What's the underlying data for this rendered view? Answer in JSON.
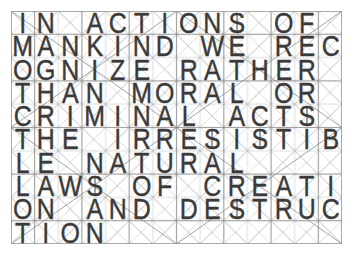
{
  "artwork": {
    "title": "IN ACTIONS OF MANKIND WE RECOGNIZE RATHER THAN MORAL OR CRIMINAL ACTS THE IRRESISTIBLE NATURAL LAWS OF CREATION AND DESTRUCTION",
    "medium_note": "geometric letterforms constructed on a ruled square grid with full X diagonals",
    "paper_color": "#ffffff",
    "ink_color": "#3a3a3a",
    "grid_color": "#b9b9b9",
    "diagonal_color": "#cfcfcf",
    "s_is_rendered_as_dollar_sign": true,
    "columns": 14,
    "rows": 10,
    "lines": [
      {
        "index": 1,
        "text": "IN ACTIONS OF"
      },
      {
        "index": 2,
        "text": "MANKIND WE REC"
      },
      {
        "index": 3,
        "text": "OGNIZE RATHER"
      },
      {
        "index": 4,
        "text": "THAN MORAL OR"
      },
      {
        "index": 5,
        "text": "CRIMINAL ACTS"
      },
      {
        "index": 6,
        "text": "THE IRRESISTIB"
      },
      {
        "index": 7,
        "text": "LE NATURAL"
      },
      {
        "index": 8,
        "text": "LAWS OF CREATI"
      },
      {
        "index": 9,
        "text": "ON AND DESTRUC"
      },
      {
        "index": 10,
        "text": "TION"
      }
    ]
  }
}
